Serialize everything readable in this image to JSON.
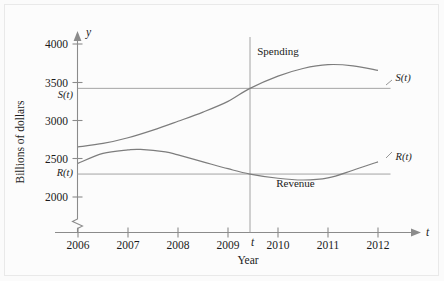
{
  "figure": {
    "background": "#fcfcfc",
    "border_color": "#e9e9e9",
    "ink_color": "#7d7d7d"
  },
  "chart_data": {
    "type": "line",
    "title": "",
    "xlabel": "Year",
    "ylabel": "Billions of dollars",
    "x_axis_name": "t",
    "y_axis_name": "y",
    "xlim": [
      2006,
      2012
    ],
    "ylim": [
      1880,
      4120
    ],
    "y_axis_break": true,
    "grid": false,
    "legend": "inline-annotations",
    "xticks": [
      2006,
      2007,
      2008,
      2009,
      2010,
      2011,
      2012
    ],
    "xticklabels": [
      "2006",
      "2007",
      "2008",
      "2009",
      "2010",
      "2011",
      "2012"
    ],
    "yticks": [
      2000,
      2500,
      3000,
      3500,
      4000
    ],
    "yticklabels": [
      "2000",
      "2500",
      "3000",
      "3500",
      "4000"
    ],
    "series": [
      {
        "name": "Spending",
        "label_on_curve": "Spending",
        "end_label": "S(t)",
        "x": [
          2006,
          2006.5,
          2007,
          2007.5,
          2008,
          2008.5,
          2009,
          2009.44,
          2010,
          2010.5,
          2011,
          2011.5,
          2012
        ],
        "values": [
          2655,
          2700,
          2775,
          2875,
          2990,
          3110,
          3250,
          3420,
          3580,
          3680,
          3730,
          3715,
          3655
        ]
      },
      {
        "name": "Revenue",
        "label_on_curve": "Revenue",
        "end_label": "R(t)",
        "x": [
          2006,
          2006.5,
          2007,
          2007.25,
          2007.75,
          2008,
          2008.5,
          2009,
          2009.44,
          2010,
          2010.5,
          2011,
          2011.5,
          2012
        ],
        "values": [
          2440,
          2570,
          2615,
          2622,
          2590,
          2550,
          2460,
          2370,
          2300,
          2245,
          2222,
          2250,
          2350,
          2460
        ]
      }
    ],
    "reference_lines": [
      {
        "name": "S(t) horizontal reference",
        "label": "S(t)",
        "orientation": "horizontal",
        "value": 3420,
        "x_from": 2006,
        "x_to": 2012.25
      },
      {
        "name": "R(t) horizontal reference",
        "label": "R(t)",
        "orientation": "horizontal",
        "value": 2300,
        "x_from": 2006,
        "x_to": 2012.25
      },
      {
        "name": "t vertical reference",
        "label": "t",
        "orientation": "vertical",
        "value": 2009.44,
        "y_from": 1880,
        "y_to": 4010
      }
    ],
    "annotations": [
      {
        "text": "Spending",
        "x": 2010.0,
        "y": 3860
      },
      {
        "text": "Revenue",
        "x": 2010.35,
        "y": 2130
      },
      {
        "text": "S(t)",
        "x": 2012.35,
        "y": 3520
      },
      {
        "text": "R(t)",
        "x": 2012.35,
        "y": 2480
      },
      {
        "text": "S(t)",
        "x": 2005.82,
        "y": 3300
      },
      {
        "text": "R(t)",
        "x": 2005.82,
        "y": 2235
      },
      {
        "text": "t",
        "x": 2009.56,
        "y": 1905
      }
    ]
  }
}
